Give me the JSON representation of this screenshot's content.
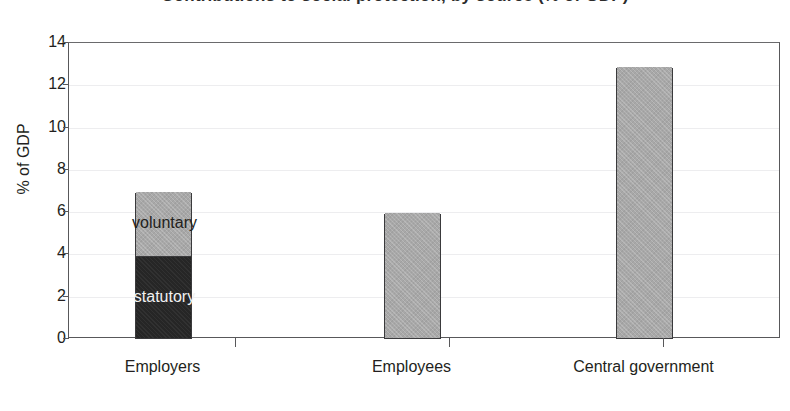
{
  "title_clipped": "Contributions to social protection, by source (% of GDP)",
  "chart_data": {
    "type": "bar",
    "title": "",
    "xlabel": "",
    "ylabel": "% of GDP",
    "ylim": [
      0,
      14
    ],
    "ytick_values": [
      0,
      2,
      4,
      6,
      8,
      10,
      12,
      14
    ],
    "ytick_labels": [
      "0",
      "2",
      "4",
      "6",
      "8",
      "10",
      "12",
      "14"
    ],
    "grid": true,
    "legend": "inline-segment-labels",
    "stacked": true,
    "categories": [
      "Employers",
      "Employees",
      "Central government"
    ],
    "series": [
      {
        "name": "statutory",
        "color": "#262626",
        "values": [
          3.9,
          null,
          null
        ]
      },
      {
        "name": "voluntary",
        "color": "#a8a8a8",
        "values": [
          3.0,
          null,
          null
        ]
      },
      {
        "name": "total",
        "color": "#a8a8a8",
        "values": [
          6.9,
          5.9,
          12.8
        ]
      }
    ],
    "bars": [
      {
        "category": "Employers",
        "total": 6.9,
        "segments": [
          {
            "label": "statutory",
            "value": 3.9,
            "color": "#262626",
            "label_color": "#f2f2f2"
          },
          {
            "label": "voluntary",
            "value": 3.0,
            "color": "#a8a8a8",
            "label_color": "#231f20"
          }
        ]
      },
      {
        "category": "Employees",
        "total": 5.9,
        "segments": [
          {
            "label": "",
            "value": 5.9,
            "color": "#a8a8a8",
            "label_color": "#231f20"
          }
        ]
      },
      {
        "category": "Central government",
        "total": 12.8,
        "segments": [
          {
            "label": "",
            "value": 12.8,
            "color": "#a8a8a8",
            "label_color": "#231f20"
          }
        ]
      }
    ],
    "annotations": [
      "voluntary",
      "statutory"
    ]
  },
  "colors": {
    "light_fill": "#a8a8a8",
    "dark_fill": "#262626",
    "axis": "#58585a",
    "grid": "#ededef",
    "text": "#231f20",
    "background": "#ffffff"
  }
}
